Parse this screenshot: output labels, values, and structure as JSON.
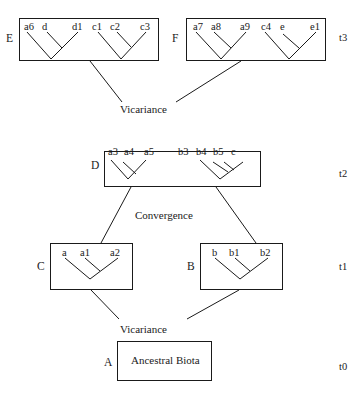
{
  "time_labels": {
    "t3": "t3",
    "t2": "t2",
    "t1": "t1",
    "t0": "t0"
  },
  "events": {
    "vicariance_upper": "Vicariance",
    "convergence": "Convergence",
    "vicariance_lower": "Vicariance"
  },
  "boxes": {
    "E": {
      "label": "E",
      "taxa": [
        "a6",
        "d",
        "d1",
        "c1",
        "c2",
        "c3"
      ]
    },
    "F": {
      "label": "F",
      "taxa": [
        "a7",
        "a8",
        "a9",
        "c4",
        "e",
        "e1"
      ]
    },
    "D": {
      "label": "D",
      "taxa": [
        "a3",
        "a4",
        "a5",
        "b3",
        "b4",
        "b5",
        "c"
      ]
    },
    "C": {
      "label": "C",
      "taxa": [
        "a",
        "a1",
        "a2"
      ]
    },
    "B": {
      "label": "B",
      "taxa": [
        "b",
        "b1",
        "b2"
      ]
    },
    "A": {
      "label": "A",
      "content": "Ancestral Biota"
    }
  },
  "colors": {
    "line": "#1a1a1a",
    "background": "#ffffff"
  }
}
